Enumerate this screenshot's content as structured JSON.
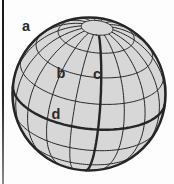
{
  "figure": {
    "background": "#fdfdfd",
    "page_edge_color": "#2a2a2a",
    "labels": [
      {
        "id": "a",
        "text": "a",
        "x": 26,
        "y": 27
      },
      {
        "id": "b",
        "text": "b",
        "x": 61,
        "y": 74
      },
      {
        "id": "c",
        "text": "c",
        "x": 97,
        "y": 75
      },
      {
        "id": "d",
        "text": "d",
        "x": 56,
        "y": 115
      }
    ],
    "globe": {
      "cx": 89,
      "cy": 94,
      "r": 76.5,
      "tilt_deg": 27,
      "axis_rotation_deg": 7,
      "cap_lat_deg": 78,
      "parallels_deg": [
        -40,
        -20,
        20,
        40,
        60
      ],
      "equator_deg": 0,
      "meridian_step_deg": 20,
      "bold_meridian_lon_deg": 10,
      "fill": "#d7d7d7",
      "line_color": "#262626",
      "label_color": "#2b2b2b",
      "thin_width": 1,
      "bold_width": 2.4,
      "limb_width": 2.6
    }
  }
}
